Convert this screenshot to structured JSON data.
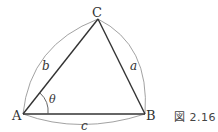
{
  "figure": {
    "caption": "図 2.16",
    "vertices": {
      "A": "A",
      "B": "B",
      "C": "C"
    },
    "sides": {
      "a": "a",
      "b": "b",
      "c": "c"
    },
    "angle": "θ",
    "colors": {
      "triangle": "#333333",
      "arcs": "#777777"
    }
  }
}
